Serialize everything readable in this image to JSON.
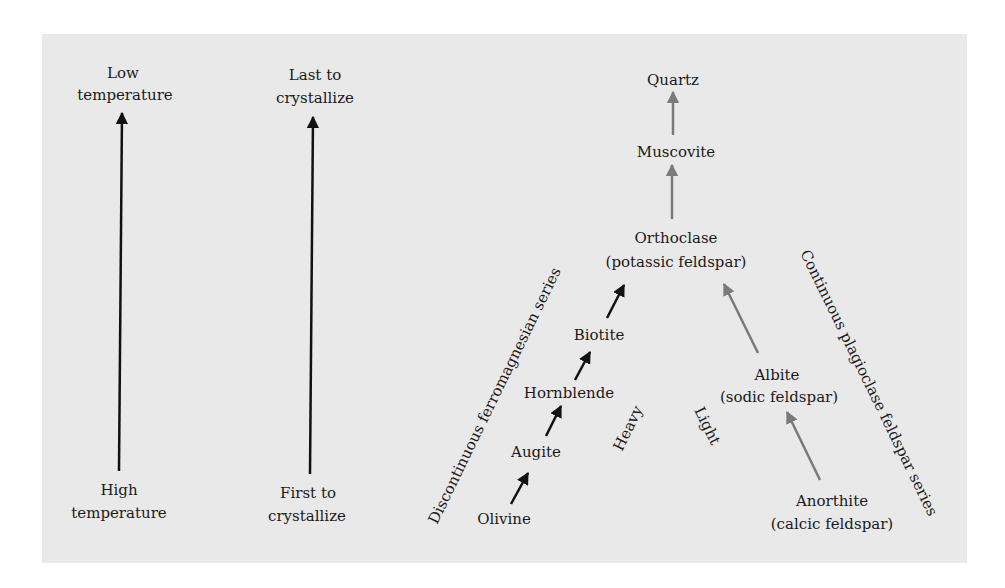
{
  "colors": {
    "background": "#ffffff",
    "panel": "#e9e9e9",
    "text": "#1a1a1a",
    "black_arrow": "#111111",
    "gray_arrow": "#7a7a7a"
  },
  "temperature_axis": {
    "top_line1": "Low",
    "top_line2": "temperature",
    "bottom_line1": "High",
    "bottom_line2": "temperature"
  },
  "crystallization_axis": {
    "top_line1": "Last to",
    "top_line2": "crystallize",
    "bottom_line1": "First to",
    "bottom_line2": "crystallize"
  },
  "discontinuous_series": {
    "label": "Discontinuous ferromagnesian series",
    "minerals": [
      "Olivine",
      "Augite",
      "Hornblende",
      "Biotite"
    ]
  },
  "continuous_series": {
    "label": "Continuous plagioclase feldspar series",
    "anorthite": {
      "name": "Anorthite",
      "note": "(calcic feldspar)"
    },
    "albite": {
      "name": "Albite",
      "note": "(sodic feldspar)"
    }
  },
  "upper": {
    "orthoclase": {
      "name": "Orthoclase",
      "note": "(potassic feldspar)"
    },
    "muscovite": "Muscovite",
    "quartz": "Quartz"
  },
  "labels": {
    "heavy": "Heavy",
    "light": "Light"
  }
}
